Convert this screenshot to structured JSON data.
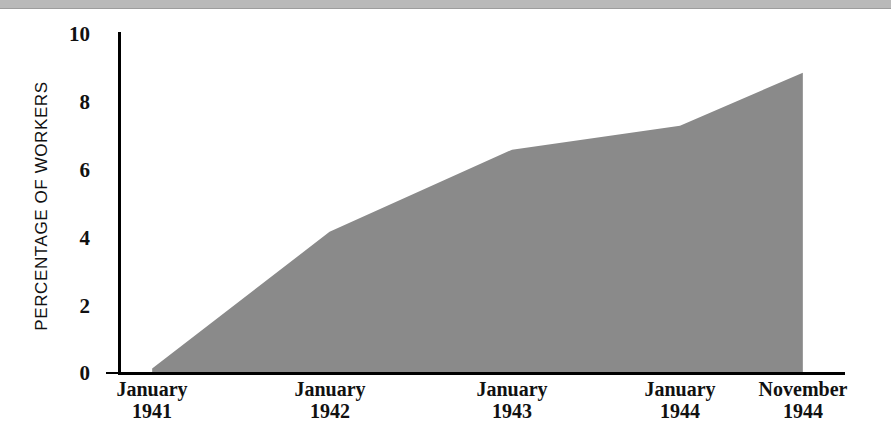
{
  "figure": {
    "background_color": "#ffffff",
    "scan_bar_color": "#b9b9b9"
  },
  "chart_data": {
    "type": "area",
    "title": "",
    "xlabel": "",
    "ylabel": "PERCENTAGE OF WORKERS",
    "categories": [
      "January 1941",
      "January 1942",
      "January 1943",
      "January 1944",
      "November 1944"
    ],
    "x_tick_lines": [
      {
        "line1": "January",
        "line2": "1941"
      },
      {
        "line1": "January",
        "line2": "1942"
      },
      {
        "line1": "January",
        "line2": "1943"
      },
      {
        "line1": "January",
        "line2": "1944"
      },
      {
        "line1": "November",
        "line2": "1944"
      }
    ],
    "values": [
      0.1,
      4.1,
      6.5,
      7.2,
      8.75
    ],
    "ylim": [
      0,
      10
    ],
    "y_ticks": [
      0,
      2,
      4,
      6,
      8,
      10
    ],
    "y_tick_labels": [
      "0",
      "2",
      "4",
      "6",
      "8",
      "10"
    ],
    "grid": false,
    "legend": "none",
    "fill_color": "#8a8a8a",
    "axis_color": "#000000",
    "vertices": [
      {
        "x": 0.047,
        "y": 0.1
      },
      {
        "x": 0.291,
        "y": 4.1
      },
      {
        "x": 0.542,
        "y": 6.5
      },
      {
        "x": 0.773,
        "y": 7.2
      },
      {
        "x": 0.942,
        "y": 8.75
      }
    ]
  }
}
